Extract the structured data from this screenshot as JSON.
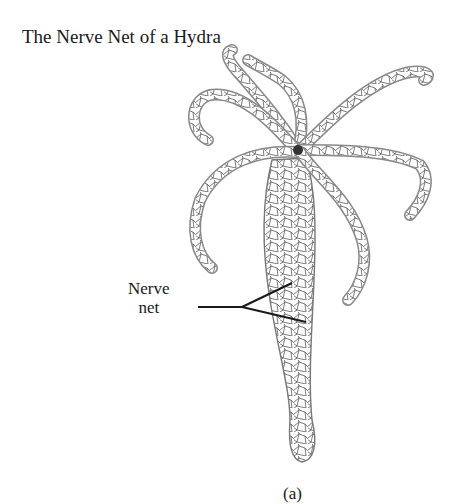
{
  "figure": {
    "title": "The Nerve Net of a Hydra",
    "label": {
      "line1": "Nerve",
      "line2": "net"
    },
    "caption": "(a)",
    "colors": {
      "ink": "#1a1a1a",
      "outline": "#666666",
      "net": "#444444",
      "background": "#ffffff"
    }
  }
}
